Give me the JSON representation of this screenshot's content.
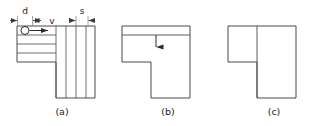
{
  "diagram": {
    "type": "engineering-machining-diagram",
    "stroke_color": "#4a4a4a",
    "text_color": "#1a1a1a",
    "background_color": "#ffffff",
    "dimensions": {
      "d_label": "d",
      "v_label": "v",
      "s_label": "s"
    },
    "figures": [
      {
        "id": "a",
        "caption": "(a)",
        "description": "L-shaped workpiece with cutter circle, feed direction arrow, four horizontal bands at left and four vertical bands at right",
        "horizontal_band_count": 4,
        "vertical_band_count": 4,
        "has_cutter_circle": true,
        "has_feed_arrow": true
      },
      {
        "id": "b",
        "caption": "(b)",
        "description": "Notched rectangular part with horizontal division line near top and downward arrow",
        "division_orientation": "horizontal",
        "has_down_arrow": true
      },
      {
        "id": "c",
        "caption": "(c)",
        "description": "Notched rectangular part with vertical division line",
        "division_orientation": "vertical",
        "has_down_arrow": false
      }
    ]
  }
}
